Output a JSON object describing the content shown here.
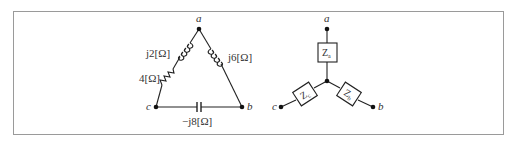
{
  "figure": {
    "border_color": "#9a9a9a",
    "line_color": "#222222"
  },
  "delta_network": {
    "nodes": {
      "a": "a",
      "b": "b",
      "c": "c"
    },
    "branches": {
      "ac_inductor": "j2[Ω]",
      "ac_resistor": "4[Ω]",
      "ab_inductor": "j6[Ω]",
      "cb_capacitor": "−j8[Ω]"
    }
  },
  "wye_network": {
    "nodes": {
      "a": "a",
      "b": "b",
      "c": "c"
    },
    "impedances": {
      "za": {
        "main": "Z",
        "sub": "a"
      },
      "zb": {
        "main": "Z",
        "sub": "b"
      },
      "zc": {
        "main": "Z",
        "sub": "c"
      }
    }
  }
}
